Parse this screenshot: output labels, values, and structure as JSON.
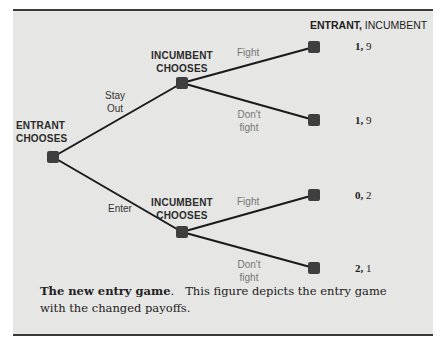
{
  "figure": {
    "header": {
      "first": "ENTRANT,",
      "second": "INCUMBENT"
    },
    "root": {
      "label_line1": "ENTRANT",
      "label_line2": "CHOOSES"
    },
    "upper_node": {
      "label_line1": "INCUMBENT",
      "label_line2": "CHOOSES",
      "incoming_action_line1": "Stay",
      "incoming_action_line2": "Out"
    },
    "lower_node": {
      "label_line1": "INCUMBENT",
      "label_line2": "CHOOSES",
      "incoming_action": "Enter"
    },
    "actions": {
      "upper_fight": "Fight",
      "upper_dont_line1": "Don't",
      "upper_dont_line2": "fight",
      "lower_fight": "Fight",
      "lower_dont_line1": "Don't",
      "lower_dont_line2": "fight"
    },
    "payoffs": [
      {
        "entrant": "1,",
        "incumbent": "9"
      },
      {
        "entrant": "1,",
        "incumbent": "9"
      },
      {
        "entrant": "0,",
        "incumbent": "2"
      },
      {
        "entrant": "2,",
        "incumbent": "1"
      }
    ],
    "colors": {
      "background": "#e6e6e4",
      "node": "#3f3f3f",
      "edge": "#1a1a1a",
      "rule": "#3a3a3a"
    }
  },
  "caption": {
    "title": "The new entry game",
    "title_suffix": ".",
    "text": "This figure depicts the entry game with the changed payoffs."
  }
}
